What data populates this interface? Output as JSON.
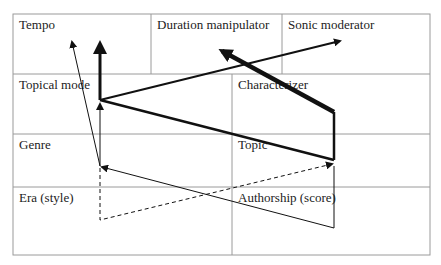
{
  "diagram": {
    "cells": {
      "tempo": "Tempo",
      "duration_manipulator": "Duration manipulator",
      "sonic_moderator": "Sonic moderator",
      "topical_mode": "Topical mode",
      "characterizer": "Characterizer",
      "genre": "Genre",
      "topic": "Topic",
      "era_style": "Era (style)",
      "authorship_score": "Authorship (score)"
    },
    "colors": {
      "grid": "#9a9a9a",
      "arrows": "#111111",
      "background": "#ffffff"
    }
  }
}
